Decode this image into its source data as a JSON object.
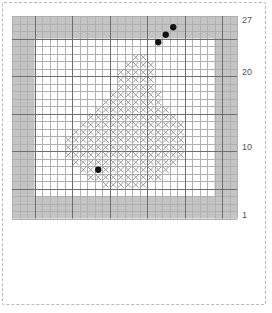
{
  "grid": {
    "columns": 30,
    "rows": 27,
    "cell_size": 7.5,
    "border_margin_cells": 3,
    "border_color": "#c4c4c4",
    "interior_color": "#ffffff",
    "minor_line_color": "#b0b0b0",
    "major_line_color": "#6e6e6e",
    "major_every": 5,
    "stitch_color": "#9a9a9a",
    "bead_color": "#111111"
  },
  "row_labels": [
    {
      "text": "27",
      "row": 27
    },
    {
      "text": "20",
      "row": 20
    },
    {
      "text": "10",
      "row": 10
    },
    {
      "text": "1",
      "row": 1
    }
  ],
  "chart_data": {
    "type": "heatmap",
    "xlabel": "",
    "ylabel": "",
    "grid": true,
    "legend_position": "none",
    "xlim": [
      1,
      30
    ],
    "ylim": [
      1,
      27
    ],
    "symbols": {
      "cross": "full cross stitch",
      "bead": "bead / french knot"
    },
    "cross_stitches": [
      {
        "row": 22,
        "cols": [
          17,
          18
        ]
      },
      {
        "row": 21,
        "cols": [
          16,
          17,
          18,
          19
        ]
      },
      {
        "row": 20,
        "cols": [
          15,
          16,
          17,
          18,
          19
        ]
      },
      {
        "row": 19,
        "cols": [
          15,
          16,
          17,
          18,
          19
        ]
      },
      {
        "row": 18,
        "cols": [
          15,
          16,
          17,
          18,
          19
        ]
      },
      {
        "row": 17,
        "cols": [
          14,
          15,
          16,
          17,
          18,
          19,
          20
        ]
      },
      {
        "row": 16,
        "cols": [
          13,
          14,
          15,
          16,
          17,
          18,
          19,
          20
        ]
      },
      {
        "row": 15,
        "cols": [
          12,
          13,
          14,
          15,
          16,
          17,
          18,
          19,
          20,
          21
        ]
      },
      {
        "row": 14,
        "cols": [
          11,
          12,
          13,
          14,
          15,
          16,
          17,
          18,
          19,
          20,
          21,
          22
        ]
      },
      {
        "row": 13,
        "cols": [
          10,
          11,
          12,
          13,
          14,
          15,
          16,
          17,
          18,
          19,
          20,
          21,
          22,
          23
        ]
      },
      {
        "row": 12,
        "cols": [
          9,
          10,
          11,
          12,
          13,
          14,
          15,
          16,
          17,
          18,
          19,
          20,
          21,
          22,
          23
        ]
      },
      {
        "row": 11,
        "cols": [
          8,
          9,
          10,
          11,
          12,
          13,
          14,
          15,
          16,
          17,
          18,
          19,
          20,
          21,
          22,
          23
        ]
      },
      {
        "row": 10,
        "cols": [
          8,
          9,
          10,
          11,
          12,
          13,
          14,
          15,
          16,
          17,
          18,
          19,
          20,
          21,
          22,
          23
        ]
      },
      {
        "row": 9,
        "cols": [
          8,
          9,
          10,
          11,
          12,
          13,
          14,
          15,
          16,
          17,
          18,
          19,
          20,
          21,
          22,
          23
        ]
      },
      {
        "row": 8,
        "cols": [
          9,
          10,
          11,
          12,
          13,
          14,
          15,
          16,
          17,
          18,
          19,
          20,
          21,
          22
        ]
      },
      {
        "row": 7,
        "cols": [
          10,
          11,
          12,
          13,
          14,
          15,
          16,
          17,
          18,
          19,
          20,
          21
        ]
      },
      {
        "row": 6,
        "cols": [
          11,
          12,
          13,
          14,
          15,
          16,
          17,
          18,
          19,
          20
        ]
      },
      {
        "row": 5,
        "cols": [
          13,
          14,
          15,
          16,
          17,
          18
        ]
      }
    ],
    "beads": [
      {
        "row": 24,
        "col": 20
      },
      {
        "row": 25,
        "col": 21
      },
      {
        "row": 26,
        "col": 22
      },
      {
        "row": 7,
        "col": 12
      }
    ]
  }
}
